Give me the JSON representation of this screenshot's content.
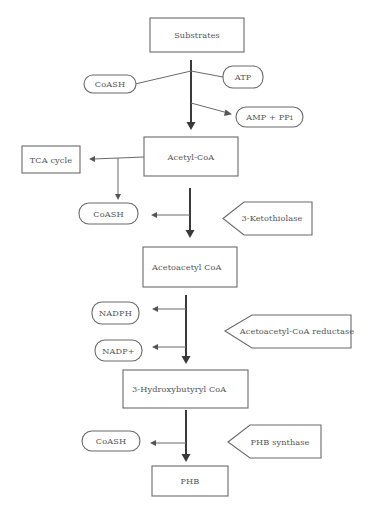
{
  "diagram": {
    "metabolites": {
      "substrates": "Substrates",
      "acetyl_coa": "Acetyl-CoA",
      "acetoacetyl_coa": "Acetoacetyl CoA",
      "hydroxybutyryl_coa": "3-Hydroxybutyryl CoA",
      "phb": "PHB",
      "tca_cycle": "TCA cycle"
    },
    "cofactors": {
      "coash_1": "CoASH",
      "atp": "ATP",
      "amp_ppi": "AMP + PPi",
      "coash_2": "CoASH",
      "nadph": "NADPH",
      "nadp_plus": "NADP+",
      "coash_3": "CoASH"
    },
    "enzymes": {
      "ketothiolase": "3-Ketothiolase",
      "reductase": "Acetoacetyl-CoA reductase",
      "synthase": "PHB synthase"
    },
    "steps": [
      {
        "from": "Substrates",
        "to": "Acetyl-CoA",
        "inputs": [
          "CoASH",
          "ATP"
        ],
        "outputs": [
          "AMP + PPi"
        ]
      },
      {
        "from": "Acetyl-CoA",
        "to": "TCA cycle",
        "outputs": [
          "CoASH"
        ]
      },
      {
        "from": "Acetyl-CoA",
        "to": "Acetoacetyl CoA",
        "enzyme": "3-Ketothiolase",
        "outputs": [
          "CoASH"
        ]
      },
      {
        "from": "Acetoacetyl CoA",
        "to": "3-Hydroxybutyryl CoA",
        "enzyme": "Acetoacetyl-CoA reductase",
        "outputs": [
          "NADPH",
          "NADP+"
        ]
      },
      {
        "from": "3-Hydroxybutyryl CoA",
        "to": "PHB",
        "enzyme": "PHB synthase",
        "outputs": [
          "CoASH"
        ]
      }
    ]
  }
}
